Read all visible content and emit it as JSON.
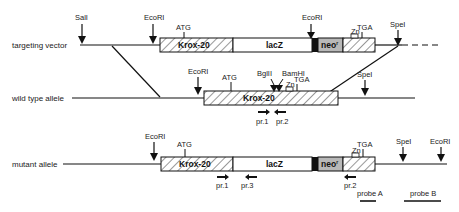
{
  "rows": [
    {
      "label": "targeting vector"
    },
    {
      "label": "wild type allele"
    },
    {
      "label": "mutant allele"
    }
  ],
  "sites": {
    "sali": "SalI",
    "ecori": "EcoRI",
    "spei": "SpeI",
    "bglii": "BglII",
    "bamhi": "BamHI"
  },
  "codons": {
    "start": "ATG",
    "stop": "TGA"
  },
  "segments": {
    "krox": "Krox-20",
    "lacz": "lacZ",
    "neo": "neo",
    "neo_sup": "r",
    "zn": "Zn"
  },
  "primers": {
    "p1": "pr.1",
    "p2": "pr.2",
    "p3": "pr.3"
  },
  "probes": {
    "a": "probe A",
    "b": "probe B"
  },
  "colors": {
    "line": "#111111",
    "neo_fill": "#b8b8b8",
    "black_bar": "#111111"
  }
}
